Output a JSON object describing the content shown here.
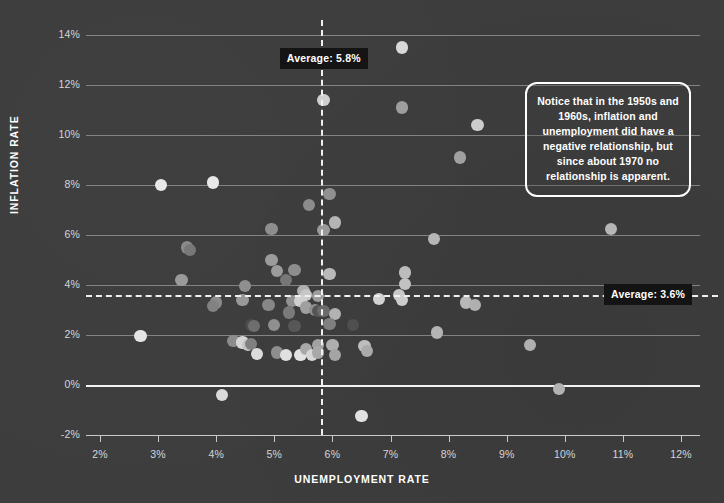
{
  "chart_data": {
    "type": "scatter",
    "title": "",
    "xlabel": "UNEMPLOYMENT RATE",
    "ylabel": "INFLATION RATE",
    "xlim": [
      1.62,
      12.4
    ],
    "ylim": [
      -2,
      14.6
    ],
    "grid": true,
    "legend": "none",
    "x_ticks": [
      "2%",
      "3%",
      "4%",
      "5%",
      "6%",
      "7%",
      "8%",
      "9%",
      "10%",
      "11%",
      "12%"
    ],
    "x_tick_values": [
      2,
      3,
      4,
      5,
      6,
      7,
      8,
      9,
      10,
      11,
      12
    ],
    "y_ticks": [
      "-2%",
      "0%",
      "2%",
      "4%",
      "6%",
      "8%",
      "10%",
      "12%",
      "14%"
    ],
    "y_tick_values": [
      -2,
      0,
      2,
      4,
      6,
      8,
      10,
      12,
      14
    ],
    "zero_line": 0,
    "reference_lines": [
      {
        "orientation": "vertical",
        "value": 5.8,
        "label": "Average: 5.8%",
        "style": "dashed"
      },
      {
        "orientation": "horizontal",
        "value": 3.6,
        "label": "Average: 3.6%",
        "style": "dashed"
      }
    ],
    "annotations": [
      {
        "text": "Notice that in the 1950s and 1960s, inflation and unemployment did have a negative relationship, but since about 1970 no relationship is apparent."
      }
    ],
    "points": [
      {
        "x": 7.2,
        "y": 13.5,
        "shade": "#d8d8d8"
      },
      {
        "x": 5.85,
        "y": 11.4,
        "shade": "#cfcfcf"
      },
      {
        "x": 7.2,
        "y": 11.1,
        "shade": "#9e9e9e"
      },
      {
        "x": 8.5,
        "y": 10.4,
        "shade": "#cccccc"
      },
      {
        "x": 8.2,
        "y": 9.1,
        "shade": "#a0a0a0"
      },
      {
        "x": 3.05,
        "y": 8.0,
        "shade": "#e8e8e8"
      },
      {
        "x": 3.95,
        "y": 8.1,
        "shade": "#e8e8e8"
      },
      {
        "x": 5.95,
        "y": 7.65,
        "shade": "#909090"
      },
      {
        "x": 5.6,
        "y": 7.2,
        "shade": "#8c8c8c"
      },
      {
        "x": 6.05,
        "y": 6.5,
        "shade": "#b4b4b4"
      },
      {
        "x": 5.85,
        "y": 6.2,
        "shade": "#9a9a9a"
      },
      {
        "x": 4.95,
        "y": 6.25,
        "shade": "#8e8e8e"
      },
      {
        "x": 7.75,
        "y": 5.85,
        "shade": "#b6b6b6"
      },
      {
        "x": 10.8,
        "y": 6.25,
        "shade": "#b6b6b6"
      },
      {
        "x": 3.5,
        "y": 5.5,
        "shade": "#8a8a8a"
      },
      {
        "x": 3.55,
        "y": 5.4,
        "shade": "#787878"
      },
      {
        "x": 4.95,
        "y": 5.0,
        "shade": "#9b9b9b"
      },
      {
        "x": 5.05,
        "y": 4.55,
        "shade": "#9b9b9b"
      },
      {
        "x": 5.35,
        "y": 4.6,
        "shade": "#8d8d8d"
      },
      {
        "x": 5.2,
        "y": 4.2,
        "shade": "#777777"
      },
      {
        "x": 5.95,
        "y": 4.45,
        "shade": "#b9b9b9"
      },
      {
        "x": 7.25,
        "y": 4.5,
        "shade": "#bcbcbc"
      },
      {
        "x": 7.25,
        "y": 4.05,
        "shade": "#c2c2c2"
      },
      {
        "x": 4.5,
        "y": 3.95,
        "shade": "#8f8f8f"
      },
      {
        "x": 3.4,
        "y": 4.2,
        "shade": "#9a9a9a"
      },
      {
        "x": 5.5,
        "y": 3.75,
        "shade": "#b0b0b0"
      },
      {
        "x": 5.55,
        "y": 3.6,
        "shade": "#c7c7c7"
      },
      {
        "x": 5.75,
        "y": 3.55,
        "shade": "#9d9d9d"
      },
      {
        "x": 7.15,
        "y": 3.6,
        "shade": "#c9c9c9"
      },
      {
        "x": 6.8,
        "y": 3.45,
        "shade": "#d2d2d2"
      },
      {
        "x": 7.2,
        "y": 3.4,
        "shade": "#cccccc"
      },
      {
        "x": 8.3,
        "y": 3.3,
        "shade": "#b8b8b8"
      },
      {
        "x": 8.45,
        "y": 3.2,
        "shade": "#b0b0b0"
      },
      {
        "x": 4.0,
        "y": 3.3,
        "shade": "#8b8b8b"
      },
      {
        "x": 3.95,
        "y": 3.15,
        "shade": "#828282"
      },
      {
        "x": 4.45,
        "y": 3.4,
        "shade": "#999999"
      },
      {
        "x": 4.9,
        "y": 3.2,
        "shade": "#878787"
      },
      {
        "x": 5.3,
        "y": 3.35,
        "shade": "#919191"
      },
      {
        "x": 5.45,
        "y": 3.35,
        "shade": "#d0d0d0"
      },
      {
        "x": 5.55,
        "y": 3.1,
        "shade": "#9f9f9f"
      },
      {
        "x": 5.7,
        "y": 3.0,
        "shade": "#8e8e8e"
      },
      {
        "x": 5.75,
        "y": 2.95,
        "shade": "#555555"
      },
      {
        "x": 5.85,
        "y": 2.95,
        "shade": "#6b6b6b"
      },
      {
        "x": 6.05,
        "y": 2.85,
        "shade": "#b2b2b2"
      },
      {
        "x": 5.25,
        "y": 2.9,
        "shade": "#7a7a7a"
      },
      {
        "x": 4.6,
        "y": 2.4,
        "shade": "#4d4d4d"
      },
      {
        "x": 4.65,
        "y": 2.35,
        "shade": "#6e6e6e"
      },
      {
        "x": 5.0,
        "y": 2.4,
        "shade": "#8f8f8f"
      },
      {
        "x": 5.35,
        "y": 2.35,
        "shade": "#575757"
      },
      {
        "x": 5.95,
        "y": 2.45,
        "shade": "#808080"
      },
      {
        "x": 6.35,
        "y": 2.4,
        "shade": "#4f4f4f"
      },
      {
        "x": 2.7,
        "y": 1.95,
        "shade": "#e4e4e4"
      },
      {
        "x": 7.8,
        "y": 2.1,
        "shade": "#b4b4b4"
      },
      {
        "x": 9.4,
        "y": 1.6,
        "shade": "#b0b0b0"
      },
      {
        "x": 4.3,
        "y": 1.75,
        "shade": "#8c8c8c"
      },
      {
        "x": 4.45,
        "y": 1.7,
        "shade": "#d6d6d6"
      },
      {
        "x": 4.55,
        "y": 1.6,
        "shade": "#c4c4c4"
      },
      {
        "x": 4.6,
        "y": 1.65,
        "shade": "#808080"
      },
      {
        "x": 4.7,
        "y": 1.25,
        "shade": "#dcdcdc"
      },
      {
        "x": 5.05,
        "y": 1.3,
        "shade": "#8e8e8e"
      },
      {
        "x": 5.2,
        "y": 1.2,
        "shade": "#e0e0e0"
      },
      {
        "x": 5.45,
        "y": 1.2,
        "shade": "#e2e2e2"
      },
      {
        "x": 5.55,
        "y": 1.45,
        "shade": "#a8a8a8"
      },
      {
        "x": 5.65,
        "y": 1.2,
        "shade": "#d6d6d6"
      },
      {
        "x": 5.75,
        "y": 1.6,
        "shade": "#a2a2a2"
      },
      {
        "x": 5.75,
        "y": 1.3,
        "shade": "#a8a8a8"
      },
      {
        "x": 6.0,
        "y": 1.6,
        "shade": "#aeaeae"
      },
      {
        "x": 6.05,
        "y": 1.2,
        "shade": "#a4a4a4"
      },
      {
        "x": 6.55,
        "y": 1.55,
        "shade": "#bdbdbd"
      },
      {
        "x": 6.6,
        "y": 1.35,
        "shade": "#aaaaaa"
      },
      {
        "x": 4.1,
        "y": -0.4,
        "shade": "#dadada"
      },
      {
        "x": 6.5,
        "y": -1.25,
        "shade": "#e2e2e2"
      },
      {
        "x": 9.9,
        "y": -0.15,
        "shade": "#b2b2b2"
      }
    ]
  },
  "colors": {
    "background": "#3d3d3d",
    "grid": "#8f8f8f",
    "zero_line": "#f2f2f2",
    "reference_line": "#f0f0f0",
    "badge_background": "#141414",
    "text": "#ffffff"
  }
}
